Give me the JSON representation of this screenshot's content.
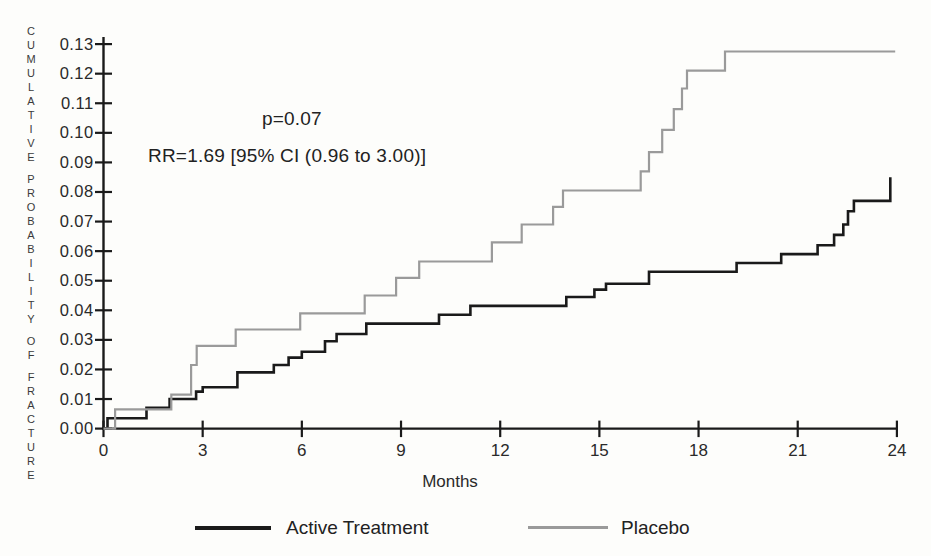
{
  "chart_data": {
    "type": "line",
    "subtype": "step",
    "title": "",
    "xlabel": "Months",
    "ylabel": "CUMULATIVE PROBABILITY OF FRACTURE",
    "ylabel_words": [
      "CUMULATIVE",
      "PROBABILITY",
      "OF",
      "FRACTURE"
    ],
    "xlim": [
      0,
      24
    ],
    "ylim": [
      0,
      0.13
    ],
    "grid": false,
    "x_tick_labels": [
      "0",
      "3",
      "6",
      "9",
      "12",
      "15",
      "18",
      "21",
      "24"
    ],
    "x_tick_values": [
      0,
      3,
      6,
      9,
      12,
      15,
      18,
      21,
      24
    ],
    "y_tick_labels": [
      "0.00",
      "0.01",
      "0.02",
      "0.03",
      "0.04",
      "0.05",
      "0.06",
      "0.07",
      "0.08",
      "0.09",
      "0.10",
      "0.11",
      "0.12",
      "0.13"
    ],
    "y_tick_values": [
      0,
      0.01,
      0.02,
      0.03,
      0.04,
      0.05,
      0.06,
      0.07,
      0.08,
      0.09,
      0.1,
      0.11,
      0.12,
      0.13
    ],
    "annotations": {
      "p_value": "p=0.07",
      "relative_risk": "RR=1.69 [95% CI (0.96 to 3.00)]"
    },
    "colors": {
      "active": "#1a1a1a",
      "placebo": "#9a9a9a",
      "axis": "#1a1a1a",
      "text": "#2a2a2a"
    },
    "legend": [
      {
        "label": "Active Treatment",
        "color": "#1a1a1a"
      },
      {
        "label": "Placebo",
        "color": "#9a9a9a"
      }
    ],
    "series": [
      {
        "name": "Active Treatment",
        "color": "#1a1a1a",
        "stroke_width": 2.6,
        "points": [
          [
            0,
            0
          ],
          [
            0.12,
            0.0035
          ],
          [
            1.3,
            0.007
          ],
          [
            2.0,
            0.01
          ],
          [
            2.8,
            0.0125
          ],
          [
            3.0,
            0.014
          ],
          [
            4.05,
            0.019
          ],
          [
            5.15,
            0.0215
          ],
          [
            5.6,
            0.024
          ],
          [
            6.0,
            0.026
          ],
          [
            6.7,
            0.0295
          ],
          [
            7.05,
            0.032
          ],
          [
            7.95,
            0.0355
          ],
          [
            10.15,
            0.0385
          ],
          [
            11.1,
            0.0415
          ],
          [
            14.0,
            0.0445
          ],
          [
            14.85,
            0.047
          ],
          [
            15.2,
            0.049
          ],
          [
            16.5,
            0.053
          ],
          [
            19.15,
            0.056
          ],
          [
            20.5,
            0.059
          ],
          [
            21.6,
            0.062
          ],
          [
            22.1,
            0.0655
          ],
          [
            22.38,
            0.069
          ],
          [
            22.52,
            0.0735
          ],
          [
            22.7,
            0.077
          ],
          [
            23.8,
            0.085
          ]
        ]
      },
      {
        "name": "Placebo",
        "color": "#9a9a9a",
        "stroke_width": 2.2,
        "points": [
          [
            0,
            0
          ],
          [
            0.35,
            0.0065
          ],
          [
            2.05,
            0.0115
          ],
          [
            2.65,
            0.0215
          ],
          [
            2.82,
            0.028
          ],
          [
            4.0,
            0.0335
          ],
          [
            5.95,
            0.039
          ],
          [
            7.9,
            0.045
          ],
          [
            8.85,
            0.051
          ],
          [
            9.55,
            0.0565
          ],
          [
            11.75,
            0.063
          ],
          [
            12.65,
            0.069
          ],
          [
            13.6,
            0.075
          ],
          [
            13.9,
            0.0805
          ],
          [
            16.25,
            0.087
          ],
          [
            16.5,
            0.0935
          ],
          [
            16.9,
            0.101
          ],
          [
            17.25,
            0.108
          ],
          [
            17.5,
            0.115
          ],
          [
            17.65,
            0.121
          ],
          [
            18.8,
            0.1275
          ],
          [
            23.95,
            0.1275
          ]
        ]
      }
    ]
  }
}
